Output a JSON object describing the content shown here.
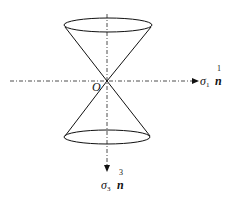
{
  "diagram": {
    "type": "double-cone-stress-diagram",
    "origin_label": "O",
    "horizontal_axis": {
      "symbol": "σ",
      "subscript": "1",
      "vector": "n",
      "superscript": "1"
    },
    "vertical_axis": {
      "symbol": "σ",
      "subscript": "3",
      "vector": "n",
      "superscript": "3"
    },
    "line_color": "#111111",
    "axis_style": "dash-dot"
  }
}
